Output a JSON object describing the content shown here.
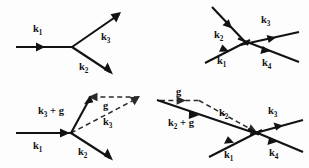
{
  "figure": {
    "background_color": "#fdfdfd",
    "ink_color": "#121212",
    "dashed_color": "#2a2a2a",
    "width": 309,
    "height": 168,
    "panel_count": 4
  },
  "labels": {
    "k1": "k",
    "k1_sub": "1",
    "k2": "k",
    "k2_sub": "2",
    "k3": "k",
    "k3_sub": "3",
    "k4": "k",
    "k4_sub": "4",
    "g": "g",
    "k3_plus_g_head": "k",
    "k3_plus_g_sub": "3",
    "k3_plus_g_tail": " + g",
    "k2_plus_g_head": "k",
    "k2_plus_g_sub": "2",
    "k2_plus_g_tail": " + g"
  },
  "panels": [
    {
      "name": "top-left-three-vector-vertex",
      "description": "Normal process: incoming k1 splits at a vertex into outgoing k3 (up-right) and k2 (down-right).",
      "vertex": {
        "x": 72,
        "y": 47
      },
      "arrows": [
        {
          "id": "k1",
          "style": "solid",
          "from": [
            16,
            47
          ],
          "to": [
            72,
            47
          ],
          "head_at": [
            45,
            47
          ],
          "head_mid": true,
          "label": "k1",
          "label_pos": [
            38,
            30
          ]
        },
        {
          "id": "k3",
          "style": "solid",
          "from": [
            72,
            47
          ],
          "to": [
            120,
            14
          ],
          "head_at": [
            120,
            14
          ],
          "head_mid": false,
          "label": "k3",
          "label_pos": [
            106,
            38
          ]
        },
        {
          "id": "k2",
          "style": "solid",
          "from": [
            72,
            47
          ],
          "to": [
            112,
            74
          ],
          "head_at": [
            112,
            74
          ],
          "head_mid": false,
          "label": "k2",
          "label_pos": [
            84,
            68
          ]
        }
      ]
    },
    {
      "name": "top-right-four-vector-crossing",
      "description": "Normal four-wave crossing: incoming k2 (from upper-left) and k1 (from lower-left) meet and produce k3 and k4 to the right.",
      "vertex": {
        "x": 245,
        "y": 42
      },
      "arrows": [
        {
          "id": "k2",
          "style": "solid",
          "from": [
            213,
            8
          ],
          "to": [
            245,
            42
          ],
          "head_at": [
            229,
            25
          ],
          "head_mid": true,
          "label": "k2",
          "label_pos": [
            219,
            35
          ]
        },
        {
          "id": "k1",
          "style": "solid",
          "from": [
            206,
            62
          ],
          "to": [
            245,
            42
          ],
          "head_at": [
            226,
            52
          ],
          "head_mid": true,
          "label": "k1",
          "label_pos": [
            222,
            62
          ]
        },
        {
          "id": "k3",
          "style": "solid",
          "from": [
            245,
            42
          ],
          "to": [
            298,
            33
          ],
          "head_at": [
            272,
            38
          ],
          "head_mid": true,
          "label": "k3",
          "label_pos": [
            265,
            21
          ]
        },
        {
          "id": "k4",
          "style": "solid",
          "from": [
            245,
            42
          ],
          "to": [
            297,
            62
          ],
          "head_at": [
            270,
            52
          ],
          "head_mid": true,
          "label": "k4",
          "label_pos": [
            266,
            63
          ]
        }
      ]
    },
    {
      "name": "bottom-left-umklapp-three-vector",
      "description": "Umklapp process: incoming k1 at vertex yields k2 (down-right) and k3 + g (up-right, solid); dashed k3 runs up-right and the dashed reciprocal lattice vector g points back left from the k3 tip to the k3 + g tip.",
      "vertex": {
        "x": 70,
        "y": 133
      },
      "arrows": [
        {
          "id": "k1",
          "style": "solid",
          "from": [
            16,
            133
          ],
          "to": [
            70,
            133
          ],
          "head_at": [
            62,
            133
          ],
          "head_mid": true,
          "label": "k1",
          "label_pos": [
            38,
            146
          ]
        },
        {
          "id": "k3_plus_g",
          "style": "solid",
          "from": [
            70,
            133
          ],
          "to": [
            90,
            96
          ],
          "head_at": [
            90,
            96
          ],
          "head_mid": false,
          "label": "k3 + g",
          "label_pos": [
            44,
            111
          ]
        },
        {
          "id": "k2",
          "style": "solid",
          "from": [
            70,
            133
          ],
          "to": [
            112,
            160
          ],
          "head_at": [
            112,
            160
          ],
          "head_mid": false,
          "label": "k2",
          "label_pos": [
            82,
            153
          ]
        },
        {
          "id": "k3",
          "style": "dashed",
          "from": [
            70,
            133
          ],
          "to": [
            138,
            97
          ],
          "head_at": [
            138,
            97
          ],
          "head_mid": false,
          "label": "k3",
          "label_pos": [
            108,
            123
          ]
        },
        {
          "id": "g",
          "style": "dashed",
          "from": [
            138,
            97
          ],
          "to": [
            90,
            97
          ],
          "head_at": [
            90,
            97
          ],
          "head_mid": false,
          "label": "g",
          "label_pos": [
            105,
            106
          ]
        }
      ]
    },
    {
      "name": "bottom-right-umklapp-four-vector",
      "description": "Umklapp four-wave crossing: incoming k2 + g travels from upper-left to the crossing, k1 enters from lower-left, and k3 and k4 leave to the right. Dashed g points right at the top-left and a dashed k2 links the g tip down to the crossing.",
      "vertex": {
        "x": 256,
        "y": 133
      },
      "arrows": [
        {
          "id": "k2_plus_g",
          "style": "solid",
          "from": [
            159,
            101
          ],
          "to": [
            256,
            133
          ],
          "head_at": [
            196,
            114
          ],
          "head_mid": true,
          "label": "k2 + g",
          "label_pos": [
            172,
            123
          ]
        },
        {
          "id": "k1",
          "style": "solid",
          "from": [
            210,
            155
          ],
          "to": [
            256,
            133
          ],
          "head_at": [
            231,
            144
          ],
          "head_mid": true,
          "label": "k1",
          "label_pos": [
            228,
            155
          ]
        },
        {
          "id": "k3",
          "style": "solid",
          "from": [
            256,
            133
          ],
          "to": [
            302,
            120
          ],
          "head_at": [
            279,
            126
          ],
          "head_mid": true,
          "label": "k3",
          "label_pos": [
            272,
            112
          ]
        },
        {
          "id": "k4",
          "style": "solid",
          "from": [
            256,
            133
          ],
          "to": [
            302,
            152
          ],
          "head_at": [
            277,
            143
          ],
          "head_mid": true,
          "label": "k4",
          "label_pos": [
            273,
            153
          ]
        },
        {
          "id": "g",
          "style": "dashed",
          "from": [
            159,
            101
          ],
          "to": [
            200,
            101
          ],
          "head_at": [
            181,
            101
          ],
          "head_mid": true,
          "label": "g",
          "label_pos": [
            179,
            92
          ]
        },
        {
          "id": "k2",
          "style": "dashed",
          "from": [
            200,
            101
          ],
          "to": [
            256,
            133
          ],
          "head_at": [
            256,
            133
          ],
          "head_mid": false,
          "label": "k2",
          "label_pos": [
            224,
            114
          ]
        }
      ]
    }
  ]
}
